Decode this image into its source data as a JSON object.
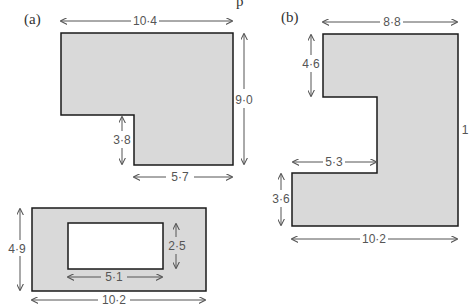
{
  "header": {
    "partial_text": "p"
  },
  "figures": [
    {
      "id": "a",
      "part_label": "(a)",
      "shape": "L-shape",
      "dimensions": {
        "top": "10·4",
        "right": "9·0",
        "notch_height": "3·8",
        "bottom": "5·7"
      }
    },
    {
      "id": "a2",
      "shape": "rectangle-with-hole",
      "dimensions": {
        "outer_height": "4·9",
        "outer_width": "10·2",
        "inner_height": "2·5",
        "inner_width": "5·1"
      }
    },
    {
      "id": "b",
      "part_label": "(b)",
      "shape": "C-shape",
      "dimensions": {
        "top": "8·8",
        "top_left_height": "4·6",
        "notch_width": "5·3",
        "bottom_left_height": "3·6",
        "bottom": "10·2",
        "right_partial": "1"
      }
    }
  ],
  "colors": {
    "fill": "#d9d9d9",
    "stroke": "#1a1a1a",
    "arrow": "#555555"
  }
}
